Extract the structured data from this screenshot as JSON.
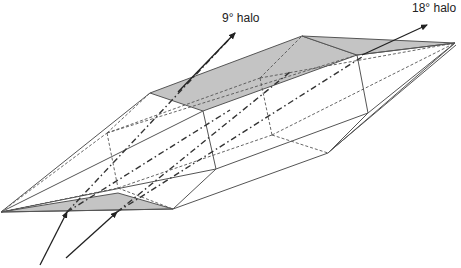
{
  "figure": {
    "labels": {
      "halo_9": "9° halo",
      "halo_18": "18° halo"
    },
    "colors": {
      "shaded_face": "#c4c4c4",
      "edges": "#555555",
      "rays": "#222222"
    },
    "rays": [
      {
        "name": "incoming-ray-1",
        "direction": "incoming"
      },
      {
        "name": "incoming-ray-2",
        "direction": "incoming"
      },
      {
        "name": "outgoing-ray-9-halo",
        "direction": "outgoing",
        "label": "9° halo"
      },
      {
        "name": "outgoing-ray-18-halo",
        "direction": "outgoing",
        "label": "18° halo"
      }
    ]
  }
}
